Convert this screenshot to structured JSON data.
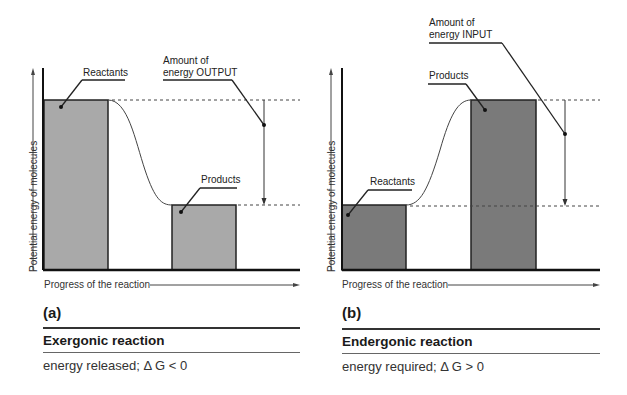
{
  "panels": [
    {
      "letter": "(a)",
      "title": "Exergonic reaction",
      "subtitle": "energy released; Δ G < 0",
      "y_axis_label": "Potential energy of molecules",
      "x_axis_label": "Progress of the reaction",
      "reactants_label": "Reactants",
      "products_label": "Products",
      "energy_label_line1": "Amount of",
      "energy_label_line2": "energy OUTPUT",
      "bar_fill": "#a9a9a9"
    },
    {
      "letter": "(b)",
      "title": "Endergonic reaction",
      "subtitle": "energy required; Δ G > 0",
      "y_axis_label": "Potential energy of molecules",
      "x_axis_label": "Progress of the reaction",
      "reactants_label": "Reactants",
      "products_label": "Products",
      "energy_label_line1": "Amount of",
      "energy_label_line2": "energy INPUT",
      "bar_fill": "#7a7a7a"
    }
  ]
}
